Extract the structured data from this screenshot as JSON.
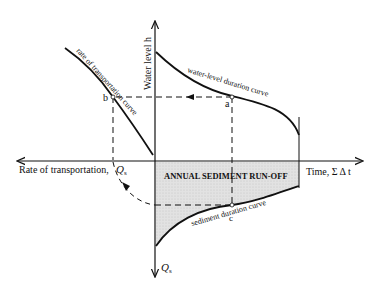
{
  "diagram": {
    "axes": {
      "vertical_up_label": "Water level h",
      "vertical_down_label": "Q",
      "vertical_down_sub": "s",
      "horizontal_right_label": "Time, Σ Δ t",
      "horizontal_left_label": "Rate of transportation,",
      "horizontal_left_q": "Q",
      "horizontal_left_sub": "s"
    },
    "curves": {
      "water_level": "water-level duration curve",
      "transport": "rate of transportation curve",
      "sediment": "sediment duration curve"
    },
    "points": {
      "a": "a",
      "b": "b",
      "c": "c"
    },
    "shaded_area_label": "ANNUAL SEDIMENT RUN-OFF",
    "colors": {
      "line": "#111111",
      "shade": "#d9d9d9"
    }
  }
}
